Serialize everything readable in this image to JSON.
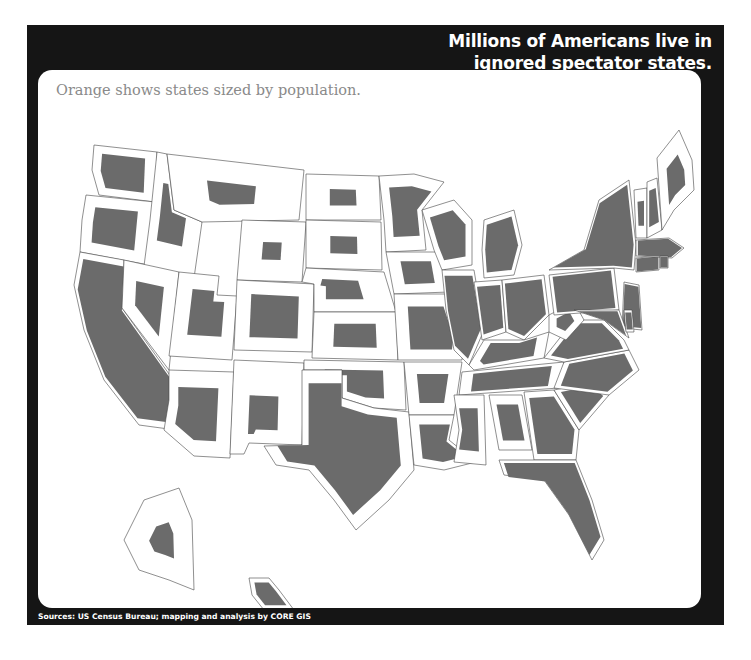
{
  "header": {
    "title_lines": [
      "Millions of Americans live in",
      "ignored spectator states."
    ]
  },
  "map": {
    "subtitle": "Orange shows states sized by population.",
    "fill_color": "#6b6b6b",
    "note": "Shaded cartogram shapes represent state population scaled inside each state outline.",
    "states": [
      {
        "name": "Washington",
        "fill_fraction": 0.55
      },
      {
        "name": "Oregon",
        "fill_fraction": 0.45
      },
      {
        "name": "California",
        "fill_fraction": 1.0
      },
      {
        "name": "Idaho",
        "fill_fraction": 0.3
      },
      {
        "name": "Nevada",
        "fill_fraction": 0.3
      },
      {
        "name": "Montana",
        "fill_fraction": 0.15
      },
      {
        "name": "Wyoming",
        "fill_fraction": 0.1
      },
      {
        "name": "Utah",
        "fill_fraction": 0.35
      },
      {
        "name": "Arizona",
        "fill_fraction": 0.45
      },
      {
        "name": "Colorado",
        "fill_fraction": 0.45
      },
      {
        "name": "New Mexico",
        "fill_fraction": 0.2
      },
      {
        "name": "North Dakota",
        "fill_fraction": 0.15
      },
      {
        "name": "South Dakota",
        "fill_fraction": 0.15
      },
      {
        "name": "Nebraska",
        "fill_fraction": 0.25
      },
      {
        "name": "Kansas",
        "fill_fraction": 0.3
      },
      {
        "name": "Oklahoma",
        "fill_fraction": 0.4
      },
      {
        "name": "Texas",
        "fill_fraction": 0.8
      },
      {
        "name": "Minnesota",
        "fill_fraction": 0.5
      },
      {
        "name": "Iowa",
        "fill_fraction": 0.35
      },
      {
        "name": "Missouri",
        "fill_fraction": 0.5
      },
      {
        "name": "Arkansas",
        "fill_fraction": 0.35
      },
      {
        "name": "Louisiana",
        "fill_fraction": 0.55
      },
      {
        "name": "Wisconsin",
        "fill_fraction": 0.6
      },
      {
        "name": "Illinois",
        "fill_fraction": 0.9
      },
      {
        "name": "Michigan",
        "fill_fraction": 0.8
      },
      {
        "name": "Indiana",
        "fill_fraction": 0.8
      },
      {
        "name": "Ohio",
        "fill_fraction": 0.9
      },
      {
        "name": "Kentucky",
        "fill_fraction": 0.6
      },
      {
        "name": "Tennessee",
        "fill_fraction": 0.7
      },
      {
        "name": "Mississippi",
        "fill_fraction": 0.45
      },
      {
        "name": "Alabama",
        "fill_fraction": 0.5
      },
      {
        "name": "Georgia",
        "fill_fraction": 0.8
      },
      {
        "name": "Florida",
        "fill_fraction": 1.0
      },
      {
        "name": "South Carolina",
        "fill_fraction": 0.7
      },
      {
        "name": "North Carolina",
        "fill_fraction": 0.85
      },
      {
        "name": "Virginia",
        "fill_fraction": 0.85
      },
      {
        "name": "West Virginia",
        "fill_fraction": 0.3
      },
      {
        "name": "Pennsylvania",
        "fill_fraction": 0.95
      },
      {
        "name": "New York",
        "fill_fraction": 1.0
      },
      {
        "name": "New Jersey",
        "fill_fraction": 1.0
      },
      {
        "name": "Maryland",
        "fill_fraction": 0.9
      },
      {
        "name": "Delaware",
        "fill_fraction": 0.7
      },
      {
        "name": "Connecticut",
        "fill_fraction": 1.0
      },
      {
        "name": "Massachusetts",
        "fill_fraction": 1.0
      },
      {
        "name": "Rhode Island",
        "fill_fraction": 1.0
      },
      {
        "name": "Vermont",
        "fill_fraction": 0.3
      },
      {
        "name": "New Hampshire",
        "fill_fraction": 0.5
      },
      {
        "name": "Maine",
        "fill_fraction": 0.3
      },
      {
        "name": "Alaska",
        "fill_fraction": 0.15
      },
      {
        "name": "Hawaii",
        "fill_fraction": 0.6
      }
    ]
  },
  "footer": {
    "source": "Sources: US Census Bureau; mapping and analysis by CORE GIS"
  }
}
